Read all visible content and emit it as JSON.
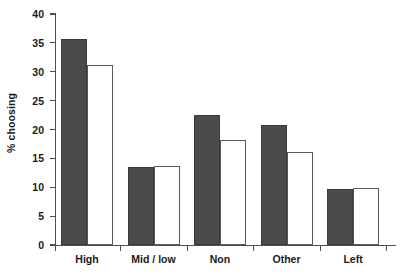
{
  "chart_data": {
    "type": "bar",
    "title": "",
    "xlabel": "",
    "ylabel": "% choosing",
    "ylim": [
      0,
      40
    ],
    "yticks": [
      0,
      5,
      10,
      15,
      20,
      25,
      30,
      35,
      40
    ],
    "grid": false,
    "legend": "none",
    "categories": [
      "High",
      "Mid / low",
      "Non",
      "Other",
      "Left"
    ],
    "series": [
      {
        "name": "series-1-dark",
        "style": "filled-dark-gray",
        "color": "#4b4b4b",
        "values": [
          35.7,
          13.5,
          22.6,
          20.8,
          9.7
        ]
      },
      {
        "name": "series-2-light",
        "style": "white-outlined",
        "color": "#ffffff",
        "values": [
          31.2,
          13.6,
          18.2,
          16.1,
          9.8
        ]
      }
    ]
  },
  "axis": {
    "y_label": "% choosing",
    "y_tick_labels": [
      "0",
      "5",
      "10",
      "15",
      "20",
      "25",
      "30",
      "35",
      "40"
    ],
    "x_tick_labels": [
      "High",
      "Mid / low",
      "Non",
      "Other",
      "Left"
    ],
    "axis_color": "#4f4f4f"
  }
}
